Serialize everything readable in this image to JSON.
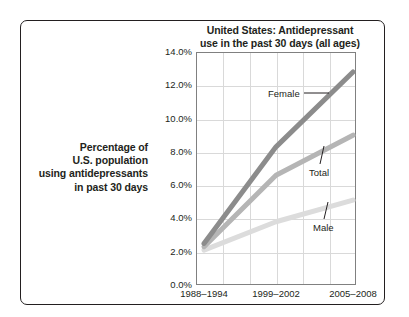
{
  "chart_data": {
    "type": "line",
    "title": "United States: Antidepressant use in the past 30 days (all ages)",
    "title_line1": "United States: Antidepressant",
    "title_line2": "use in the past 30 days (all ages)",
    "xlabel": "",
    "ylabel": "Percentage of U.S. population using antidepressants in past 30 days",
    "ylabel_lines": [
      "Percentage of",
      "U.S. population",
      "using antidepressants",
      "in past 30 days"
    ],
    "categories": [
      "1988–1994",
      "1999–2002",
      "2005–2008"
    ],
    "ylim": [
      0,
      14
    ],
    "ytick_step": 2,
    "yticks": [
      "0.0%",
      "2.0%",
      "4.0%",
      "6.0%",
      "8.0%",
      "10.0%",
      "12.0%",
      "14.0%"
    ],
    "ytick_values": [
      0,
      2,
      4,
      6,
      8,
      10,
      12,
      14
    ],
    "grid": true,
    "legend_position": "inline-annotations",
    "series": [
      {
        "name": "Female",
        "values": [
          2.5,
          8.3,
          12.8
        ],
        "color": "#8c8c8c"
      },
      {
        "name": "Total",
        "values": [
          2.3,
          6.6,
          9.0
        ],
        "color": "#b5b5b5"
      },
      {
        "name": "Male",
        "values": [
          2.1,
          3.8,
          5.1
        ],
        "color": "#dcdcdc"
      }
    ],
    "annotations": [
      {
        "label": "Female",
        "series": "Female"
      },
      {
        "label": "Total",
        "series": "Total"
      },
      {
        "label": "Male",
        "series": "Male"
      }
    ]
  },
  "colors": {
    "frame": "#231f20",
    "plot_border": "#808080",
    "gridline": "#d9d9d9",
    "text": "#231f20",
    "background": "#ffffff",
    "female": "#8c8c8c",
    "total": "#b5b5b5",
    "male": "#dcdcdc"
  }
}
